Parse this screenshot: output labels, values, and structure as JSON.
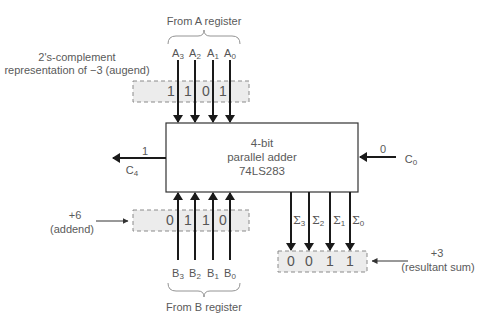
{
  "adder": {
    "line1": "4-bit",
    "line2": "parallel adder",
    "line3": "74LS283"
  },
  "a_register": {
    "title": "From A register",
    "inputs": [
      {
        "name": "A",
        "sub": "3"
      },
      {
        "name": "A",
        "sub": "2"
      },
      {
        "name": "A",
        "sub": "1"
      },
      {
        "name": "A",
        "sub": "0"
      }
    ],
    "bits": [
      "1",
      "1",
      "0",
      "1"
    ],
    "description_line1": "2's-complement",
    "description_line2": "representation of −3 (augend)"
  },
  "b_register": {
    "title": "From B register",
    "inputs": [
      {
        "name": "B",
        "sub": "3"
      },
      {
        "name": "B",
        "sub": "2"
      },
      {
        "name": "B",
        "sub": "1"
      },
      {
        "name": "B",
        "sub": "0"
      }
    ],
    "bits": [
      "0",
      "1",
      "1",
      "0"
    ],
    "description_line1": "+6",
    "description_line2": "(addend)"
  },
  "sum_output": {
    "outputs": [
      {
        "name": "Σ",
        "sub": "3"
      },
      {
        "name": "Σ",
        "sub": "2"
      },
      {
        "name": "Σ",
        "sub": "1"
      },
      {
        "name": "Σ",
        "sub": "0"
      }
    ],
    "bits": [
      "0",
      "0",
      "1",
      "1"
    ],
    "description_line1": "+3",
    "description_line2": "(resultant sum)"
  },
  "carry_out": {
    "name": "C",
    "sub": "4",
    "value": "1"
  },
  "carry_in": {
    "name": "C",
    "sub": "0",
    "value": "0"
  },
  "colors": {
    "line": "#1a1a1a",
    "register_fill": "#ececec",
    "dash": "#8a8a8a",
    "text": "#5a5a5a"
  }
}
